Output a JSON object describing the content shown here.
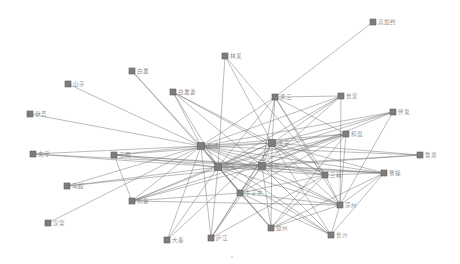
{
  "diagram": {
    "type": "network-graph",
    "colors": {
      "node": "#7d7d7d",
      "edge": "#6e6e6e",
      "label": "#8a8a8a",
      "background": "#ffffff"
    },
    "nodes": [
      {
        "id": "n0",
        "label": "高加约",
        "x": 373,
        "y": 22,
        "size": 6
      },
      {
        "id": "n1",
        "label": "林某",
        "x": 225,
        "y": 56,
        "size": 6
      },
      {
        "id": "n2",
        "label": "白发",
        "x": 132,
        "y": 71,
        "size": 6
      },
      {
        "id": "n3",
        "label": "山子",
        "x": 68,
        "y": 84,
        "size": 6
      },
      {
        "id": "n4",
        "label": "白发妻",
        "x": 173,
        "y": 92,
        "size": 6
      },
      {
        "id": "n5",
        "label": "伊吾",
        "x": 30,
        "y": 114,
        "size": 6
      },
      {
        "id": "n6",
        "label": "黄三",
        "x": 275,
        "y": 97,
        "size": 6
      },
      {
        "id": "n7",
        "label": "长安",
        "x": 341,
        "y": 96,
        "size": 6
      },
      {
        "id": "n8",
        "label": "伴鬼",
        "x": 393,
        "y": 112,
        "size": 6
      },
      {
        "id": "n9",
        "label": "荀彧",
        "x": 201,
        "y": 146,
        "size": 7
      },
      {
        "id": "n10",
        "label": "桓温",
        "x": 346,
        "y": 134,
        "size": 6
      },
      {
        "id": "n11",
        "label": "王子",
        "x": 272,
        "y": 143,
        "size": 7
      },
      {
        "id": "n12",
        "label": "鲁肃",
        "x": 420,
        "y": 155,
        "size": 6
      },
      {
        "id": "n13",
        "label": "太守",
        "x": 33,
        "y": 154,
        "size": 6
      },
      {
        "id": "n14",
        "label": "三国",
        "x": 114,
        "y": 155,
        "size": 6
      },
      {
        "id": "n15",
        "label": "胡长",
        "x": 218,
        "y": 167,
        "size": 7
      },
      {
        "id": "n16",
        "label": "张任",
        "x": 262,
        "y": 166,
        "size": 7
      },
      {
        "id": "n17",
        "label": "三辅",
        "x": 325,
        "y": 175,
        "size": 6
      },
      {
        "id": "n18",
        "label": "曹操",
        "x": 384,
        "y": 173,
        "size": 6
      },
      {
        "id": "n19",
        "label": "马超",
        "x": 67,
        "y": 186,
        "size": 6
      },
      {
        "id": "n20",
        "label": "牛子中",
        "x": 240,
        "y": 193,
        "size": 6
      },
      {
        "id": "n21",
        "label": "刘备",
        "x": 132,
        "y": 201,
        "size": 6
      },
      {
        "id": "n22",
        "label": "凉州",
        "x": 340,
        "y": 205,
        "size": 6
      },
      {
        "id": "n23",
        "label": "汉室",
        "x": 48,
        "y": 223,
        "size": 6
      },
      {
        "id": "n24",
        "label": "益州",
        "x": 271,
        "y": 228,
        "size": 6
      },
      {
        "id": "n25",
        "label": "大秦",
        "x": 167,
        "y": 240,
        "size": 6
      },
      {
        "id": "n26",
        "label": "庐江",
        "x": 211,
        "y": 238,
        "size": 6
      },
      {
        "id": "n27",
        "label": "长沙",
        "x": 331,
        "y": 235,
        "size": 6
      }
    ],
    "edges": [
      [
        "n6",
        "n0"
      ],
      [
        "n6",
        "n7"
      ],
      [
        "n6",
        "n9"
      ],
      [
        "n6",
        "n15"
      ],
      [
        "n6",
        "n16"
      ],
      [
        "n6",
        "n11"
      ],
      [
        "n6",
        "n17"
      ],
      [
        "n6",
        "n22"
      ],
      [
        "n6",
        "n10"
      ],
      [
        "n3",
        "n9"
      ],
      [
        "n5",
        "n9"
      ],
      [
        "n2",
        "n15"
      ],
      [
        "n2",
        "n9"
      ],
      [
        "n4",
        "n9"
      ],
      [
        "n4",
        "n15"
      ],
      [
        "n4",
        "n16"
      ],
      [
        "n4",
        "n11"
      ],
      [
        "n4",
        "n17"
      ],
      [
        "n1",
        "n15"
      ],
      [
        "n1",
        "n17"
      ],
      [
        "n1",
        "n11"
      ],
      [
        "n7",
        "n9"
      ],
      [
        "n7",
        "n15"
      ],
      [
        "n7",
        "n16"
      ],
      [
        "n7",
        "n11"
      ],
      [
        "n7",
        "n22"
      ],
      [
        "n8",
        "n9"
      ],
      [
        "n8",
        "n15"
      ],
      [
        "n8",
        "n16"
      ],
      [
        "n8",
        "n11"
      ],
      [
        "n8",
        "n22"
      ],
      [
        "n10",
        "n9"
      ],
      [
        "n10",
        "n15"
      ],
      [
        "n10",
        "n16"
      ],
      [
        "n10",
        "n11"
      ],
      [
        "n10",
        "n21"
      ],
      [
        "n10",
        "n20"
      ],
      [
        "n10",
        "n24"
      ],
      [
        "n10",
        "n22"
      ],
      [
        "n12",
        "n9"
      ],
      [
        "n12",
        "n15"
      ],
      [
        "n12",
        "n11"
      ],
      [
        "n12",
        "n16"
      ],
      [
        "n13",
        "n9"
      ],
      [
        "n13",
        "n15"
      ],
      [
        "n13",
        "n16"
      ],
      [
        "n14",
        "n9"
      ],
      [
        "n14",
        "n15"
      ],
      [
        "n14",
        "n16"
      ],
      [
        "n14",
        "n11"
      ],
      [
        "n14",
        "n21"
      ],
      [
        "n14",
        "n18"
      ],
      [
        "n19",
        "n9"
      ],
      [
        "n19",
        "n15"
      ],
      [
        "n19",
        "n16"
      ],
      [
        "n23",
        "n9"
      ],
      [
        "n9",
        "n15"
      ],
      [
        "n9",
        "n16"
      ],
      [
        "n9",
        "n11"
      ],
      [
        "n9",
        "n17"
      ],
      [
        "n9",
        "n18"
      ],
      [
        "n9",
        "n22"
      ],
      [
        "n9",
        "n20"
      ],
      [
        "n9",
        "n24"
      ],
      [
        "n9",
        "n25"
      ],
      [
        "n9",
        "n26"
      ],
      [
        "n9",
        "n27"
      ],
      [
        "n9",
        "n21"
      ],
      [
        "n11",
        "n15"
      ],
      [
        "n11",
        "n16"
      ],
      [
        "n11",
        "n17"
      ],
      [
        "n11",
        "n18"
      ],
      [
        "n11",
        "n22"
      ],
      [
        "n11",
        "n20"
      ],
      [
        "n11",
        "n24"
      ],
      [
        "n11",
        "n25"
      ],
      [
        "n11",
        "n26"
      ],
      [
        "n11",
        "n27"
      ],
      [
        "n11",
        "n21"
      ],
      [
        "n15",
        "n16"
      ],
      [
        "n15",
        "n17"
      ],
      [
        "n15",
        "n18"
      ],
      [
        "n15",
        "n22"
      ],
      [
        "n15",
        "n20"
      ],
      [
        "n15",
        "n24"
      ],
      [
        "n15",
        "n25"
      ],
      [
        "n15",
        "n26"
      ],
      [
        "n15",
        "n27"
      ],
      [
        "n15",
        "n21"
      ],
      [
        "n16",
        "n17"
      ],
      [
        "n16",
        "n18"
      ],
      [
        "n16",
        "n22"
      ],
      [
        "n16",
        "n20"
      ],
      [
        "n16",
        "n24"
      ],
      [
        "n16",
        "n26"
      ],
      [
        "n16",
        "n27"
      ],
      [
        "n16",
        "n21"
      ],
      [
        "n17",
        "n18"
      ],
      [
        "n17",
        "n22"
      ],
      [
        "n17",
        "n20"
      ],
      [
        "n17",
        "n24"
      ],
      [
        "n17",
        "n26"
      ],
      [
        "n18",
        "n22"
      ],
      [
        "n18",
        "n27"
      ],
      [
        "n18",
        "n24"
      ],
      [
        "n20",
        "n24"
      ],
      [
        "n20",
        "n22"
      ],
      [
        "n20",
        "n27"
      ],
      [
        "n20",
        "n26"
      ],
      [
        "n22",
        "n27"
      ],
      [
        "n24",
        "n22"
      ],
      [
        "n21",
        "n20"
      ],
      [
        "n21",
        "n22"
      ]
    ],
    "footer_dot": {
      "x": 232,
      "y": 257
    }
  }
}
